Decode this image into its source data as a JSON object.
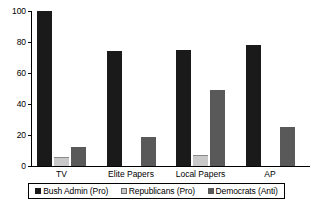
{
  "chart_data": {
    "type": "bar",
    "title": "",
    "subtitle": "",
    "xlabel": "",
    "ylabel": "",
    "ylim": [
      0,
      100
    ],
    "yticks": [
      0,
      20,
      40,
      60,
      80,
      100
    ],
    "ytick_labels": [
      "0",
      "20",
      "40",
      "60",
      "80",
      "100"
    ],
    "grid": false,
    "legend_position": "bottom",
    "orientation": "vertical",
    "grouping": "clustered",
    "categories": [
      "TV",
      "Elite Papers",
      "Local Papers",
      "AP"
    ],
    "series": [
      {
        "name": "Bush Admin (Pro)",
        "color": "#1a1a1a",
        "values": [
          100,
          74,
          75,
          78
        ]
      },
      {
        "name": "Republicans (Pro)",
        "color": "#c9c9c9",
        "values": [
          6,
          0,
          7,
          0
        ]
      },
      {
        "name": "Democrats (Anti)",
        "color": "#595959",
        "values": [
          12,
          19,
          49,
          25
        ]
      }
    ],
    "annotations": []
  },
  "legend": {
    "items": [
      {
        "label": "Bush Admin (Pro)"
      },
      {
        "label": "Republicans (Pro)"
      },
      {
        "label": "Democrats (Anti)"
      }
    ]
  },
  "axes": {
    "y": {
      "tick_labels": [
        "100",
        "80",
        "60",
        "40",
        "20",
        "0"
      ]
    },
    "x": {
      "tick_labels": [
        "TV",
        "Elite Papers",
        "Local Papers",
        "AP"
      ]
    }
  },
  "colors": {
    "background": "#ffffff",
    "axis": "#000000",
    "text": "#000000",
    "series_bush": "#1a1a1a",
    "series_republicans": "#c9c9c9",
    "series_democrats": "#595959"
  }
}
